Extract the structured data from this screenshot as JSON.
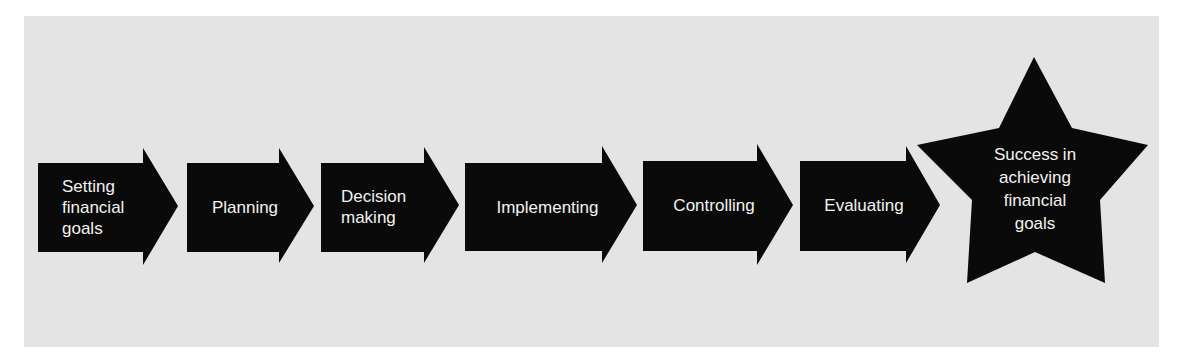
{
  "diagram": {
    "type": "process-flow",
    "colors": {
      "background": "#ffffff",
      "panel": "#e4e4e4",
      "shape_fill": "#0a0a0a",
      "text": "#f2f2f2"
    },
    "steps": [
      {
        "label": "Setting\nfinancial\ngoals",
        "shape": "arrow"
      },
      {
        "label": "Planning",
        "shape": "arrow"
      },
      {
        "label": "Decision\nmaking",
        "shape": "arrow"
      },
      {
        "label": "Implementing",
        "shape": "arrow"
      },
      {
        "label": "Controlling",
        "shape": "arrow"
      },
      {
        "label": "Evaluating",
        "shape": "arrow"
      }
    ],
    "goal": {
      "label": "Success in\nachieving\nfinancial\ngoals",
      "shape": "star"
    }
  }
}
